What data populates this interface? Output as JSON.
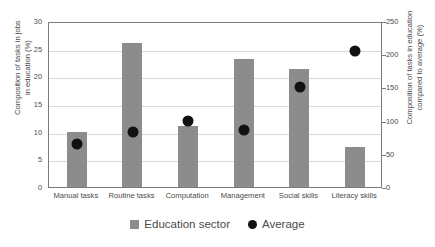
{
  "chart_data": {
    "type": "bar",
    "title": "",
    "subtitle": "",
    "categories": [
      "Manual tasks",
      "Routine tasks",
      "Computation",
      "Management",
      "Social skills",
      "Literacy skills"
    ],
    "series": [
      {
        "name": "Education sector",
        "type": "bar",
        "axis": "left",
        "color": "#8c8c8c",
        "values": [
          10,
          26,
          11,
          23.2,
          21.3,
          7.2
        ]
      },
      {
        "name": "Average",
        "type": "scatter",
        "axis": "right",
        "color": "#111111",
        "values": [
          65,
          83,
          99,
          86,
          151,
          205
        ]
      }
    ],
    "xlabel": "",
    "ylabel": "Composition of tasks in jobs\nin education (%)",
    "y2label": "Composition of tasks in education\ncompared to average (%)",
    "ylim": [
      0,
      30
    ],
    "yticks": [
      0,
      5,
      10,
      15,
      20,
      25,
      30
    ],
    "y2lim": [
      0,
      250
    ],
    "y2ticks": [
      0,
      50,
      100,
      150,
      200,
      250
    ],
    "grid": true,
    "legend_position": "bottom-center",
    "legend": [
      "Education sector",
      "Average"
    ]
  },
  "legend": {
    "items": [
      {
        "label": "Education sector",
        "marker": "square"
      },
      {
        "label": "Average",
        "marker": "dot"
      }
    ]
  },
  "axes": {
    "left_title_line1": "Composition of tasks in jobs",
    "left_title_line2": "in education (%)",
    "right_title_line1": "Composition of tasks in education",
    "right_title_line2": "compared to average (%)",
    "left_ticks": [
      "30",
      "25",
      "20",
      "15",
      "10",
      "5",
      "0"
    ],
    "right_ticks": [
      "250",
      "200",
      "150",
      "100",
      "50",
      "0"
    ]
  }
}
